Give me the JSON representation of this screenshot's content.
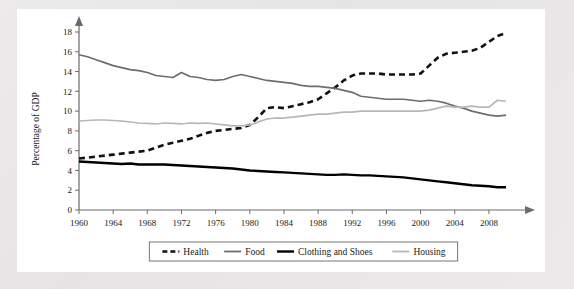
{
  "figure": {
    "background_color": "#ffffff",
    "page_background_color": "#e8e8e8",
    "axis_color": "#6b6b6b"
  },
  "chart_data": {
    "type": "line",
    "title": "",
    "subtitle": "",
    "xlabel": "",
    "ylabel": "Percentage of GDP",
    "xlim": [
      1960,
      2010
    ],
    "ylim": [
      0,
      18
    ],
    "ytick_labels": [
      "0",
      "2",
      "4",
      "6",
      "8",
      "10",
      "12",
      "14",
      "16",
      "18"
    ],
    "ytick_values": [
      0,
      2,
      4,
      6,
      8,
      10,
      12,
      14,
      16,
      18
    ],
    "xtick_labels": [
      "1960",
      "1964",
      "1968",
      "1972",
      "1976",
      "1980",
      "1984",
      "1988",
      "1992",
      "1996",
      "2000",
      "2004",
      "2008"
    ],
    "xtick_values": [
      1960,
      1964,
      1968,
      1972,
      1976,
      1980,
      1984,
      1988,
      1992,
      1996,
      2000,
      2004,
      2008
    ],
    "grid": false,
    "legend_position": "bottom",
    "x": [
      1960,
      1961,
      1962,
      1963,
      1964,
      1965,
      1966,
      1967,
      1968,
      1969,
      1970,
      1971,
      1972,
      1973,
      1974,
      1975,
      1976,
      1977,
      1978,
      1979,
      1980,
      1981,
      1982,
      1983,
      1984,
      1985,
      1986,
      1987,
      1988,
      1989,
      1990,
      1991,
      1992,
      1993,
      1994,
      1995,
      1996,
      1997,
      1998,
      1999,
      2000,
      2001,
      2002,
      2003,
      2004,
      2005,
      2006,
      2007,
      2008,
      2009,
      2010
    ],
    "series": [
      {
        "name": "Health",
        "color": "#111111",
        "style": "dashed",
        "width": 2.6,
        "values": [
          5.2,
          5.3,
          5.4,
          5.5,
          5.6,
          5.7,
          5.8,
          5.9,
          6.0,
          6.3,
          6.6,
          6.8,
          7.0,
          7.2,
          7.5,
          7.8,
          8.0,
          8.1,
          8.2,
          8.3,
          8.6,
          9.4,
          10.3,
          10.4,
          10.3,
          10.5,
          10.7,
          10.9,
          11.2,
          11.8,
          12.4,
          13.1,
          13.6,
          13.8,
          13.8,
          13.8,
          13.7,
          13.7,
          13.7,
          13.7,
          13.8,
          14.6,
          15.4,
          15.8,
          15.9,
          16.0,
          16.1,
          16.4,
          17.0,
          17.6,
          17.9
        ]
      },
      {
        "name": "Food",
        "color": "#6d6d6d",
        "style": "solid",
        "width": 1.7,
        "values": [
          15.7,
          15.5,
          15.2,
          14.9,
          14.6,
          14.4,
          14.2,
          14.1,
          13.9,
          13.6,
          13.5,
          13.4,
          13.9,
          13.5,
          13.4,
          13.2,
          13.1,
          13.2,
          13.5,
          13.7,
          13.5,
          13.3,
          13.1,
          13.0,
          12.9,
          12.8,
          12.6,
          12.5,
          12.5,
          12.4,
          12.3,
          12.1,
          11.9,
          11.5,
          11.4,
          11.3,
          11.2,
          11.2,
          11.2,
          11.1,
          11.0,
          11.1,
          11.0,
          10.8,
          10.5,
          10.3,
          10.0,
          9.8,
          9.6,
          9.5,
          9.6
        ]
      },
      {
        "name": "Clothing and Shoes",
        "color": "#000000",
        "style": "solid",
        "width": 2.4,
        "values": [
          4.9,
          4.85,
          4.8,
          4.75,
          4.7,
          4.65,
          4.7,
          4.6,
          4.6,
          4.6,
          4.6,
          4.55,
          4.5,
          4.45,
          4.4,
          4.35,
          4.3,
          4.25,
          4.2,
          4.1,
          4.0,
          3.95,
          3.9,
          3.85,
          3.8,
          3.75,
          3.7,
          3.65,
          3.6,
          3.55,
          3.55,
          3.6,
          3.55,
          3.5,
          3.5,
          3.45,
          3.4,
          3.35,
          3.3,
          3.2,
          3.1,
          3.0,
          2.9,
          2.8,
          2.7,
          2.6,
          2.5,
          2.45,
          2.4,
          2.3,
          2.3
        ]
      },
      {
        "name": "Housing",
        "color": "#b7b7b7",
        "style": "solid",
        "width": 1.7,
        "values": [
          9.0,
          9.05,
          9.1,
          9.1,
          9.05,
          9.0,
          8.9,
          8.8,
          8.75,
          8.7,
          8.8,
          8.75,
          8.7,
          8.8,
          8.75,
          8.8,
          8.7,
          8.6,
          8.5,
          8.5,
          8.6,
          8.9,
          9.2,
          9.3,
          9.3,
          9.4,
          9.5,
          9.6,
          9.7,
          9.7,
          9.8,
          9.9,
          9.9,
          10.0,
          10.0,
          10.0,
          10.0,
          10.0,
          10.0,
          10.0,
          10.0,
          10.1,
          10.3,
          10.5,
          10.4,
          10.4,
          10.5,
          10.4,
          10.4,
          11.1,
          11.0
        ]
      }
    ],
    "legend": [
      {
        "label": "Health",
        "color": "#111111",
        "style": "dashed"
      },
      {
        "label": "Food",
        "color": "#6d6d6d",
        "style": "solid"
      },
      {
        "label": "Clothing and Shoes",
        "color": "#000000",
        "style": "solid"
      },
      {
        "label": "Housing",
        "color": "#b7b7b7",
        "style": "solid"
      }
    ]
  }
}
